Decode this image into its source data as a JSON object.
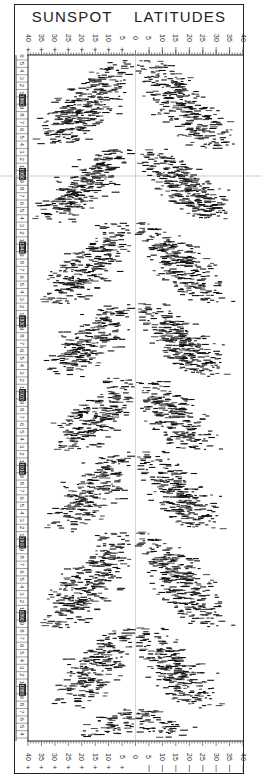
{
  "chart_data": {
    "type": "scatter",
    "subtype": "butterfly-diagram",
    "title": "SUNSPOT LATITUDES",
    "xlabel": "Latitude (degrees)",
    "ylabel": "Year",
    "x_ticks": [
      "+40",
      "+35",
      "+30",
      "+25",
      "+20",
      "+15",
      "+10",
      "+5",
      "0",
      "-5",
      "-10",
      "-15",
      "-20",
      "-25",
      "-30",
      "-35",
      "-40"
    ],
    "xlim": [
      40,
      -40
    ],
    "year_minor_labels": [
      "1",
      "2",
      "3",
      "4",
      "5",
      "6",
      "7",
      "8",
      "9"
    ],
    "decade_labels": [
      "1960",
      "1950",
      "1940",
      "1930",
      "1920",
      "1910",
      "1900",
      "1890",
      "1880"
    ],
    "ylim_years": [
      1874,
      1966
    ],
    "y_direction": "time increases upward",
    "grid": false,
    "cycles": [
      {
        "label": "Cycle (1954-1964)",
        "start_year": 1954,
        "end_year": 1966,
        "max_lat": 38,
        "peak_density": 0.95
      },
      {
        "label": "Cycle (1944-1954)",
        "start_year": 1944,
        "end_year": 1954,
        "max_lat": 40,
        "peak_density": 0.95
      },
      {
        "label": "Cycle (1933-1944)",
        "start_year": 1933,
        "end_year": 1944,
        "max_lat": 36,
        "peak_density": 0.85
      },
      {
        "label": "Cycle (1923-1933)",
        "start_year": 1923,
        "end_year": 1933,
        "max_lat": 36,
        "peak_density": 0.9
      },
      {
        "label": "Cycle (1913-1923)",
        "start_year": 1913,
        "end_year": 1923,
        "max_lat": 30,
        "peak_density": 0.8
      },
      {
        "label": "Cycle (1902-1913)",
        "start_year": 1902,
        "end_year": 1913,
        "max_lat": 34,
        "peak_density": 0.75
      },
      {
        "label": "Cycle (1889-1902)",
        "start_year": 1889,
        "end_year": 1902,
        "max_lat": 36,
        "peak_density": 0.8
      },
      {
        "label": "Cycle (1878-1889)",
        "start_year": 1878,
        "end_year": 1889,
        "max_lat": 32,
        "peak_density": 0.75
      },
      {
        "label": "Cycle (1874-1878 tail)",
        "start_year": 1874,
        "end_year": 1878,
        "max_lat": 18,
        "peak_density": 0.55
      }
    ]
  },
  "header": {
    "title_word1": "SUNSPOT",
    "title_word2": "LATITUDES"
  },
  "colors": {
    "ink": "#111111",
    "frame": "#222222",
    "paper": "#ffffff"
  }
}
